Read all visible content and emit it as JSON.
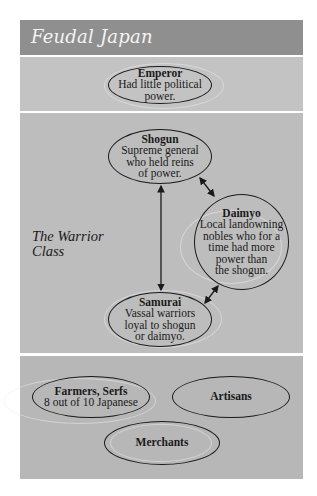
{
  "header": {
    "title": "Feudal Japan"
  },
  "sections": {
    "emperor": {
      "node": {
        "title": "Emperor",
        "description_lines": [
          "Had little political",
          "power."
        ]
      }
    },
    "warrior_class": {
      "label_lines": [
        "The Warrior",
        "Class"
      ],
      "shogun": {
        "title": "Shogun",
        "description_lines": [
          "Supreme general",
          "who held reins",
          "of power."
        ]
      },
      "daimyo": {
        "title": "Daimyo",
        "description_lines": [
          "Local landowning",
          "nobles who for a",
          "time had more",
          "power than",
          "the shogun."
        ]
      },
      "samurai": {
        "title": "Samurai",
        "description_lines": [
          "Vassal warriors",
          "loyal to shogun",
          "or daimyo."
        ]
      },
      "connections": [
        {
          "from": "Shogun",
          "to": "Samurai",
          "type": "double-arrow"
        },
        {
          "from": "Shogun",
          "to": "Daimyo",
          "type": "double-arrow"
        },
        {
          "from": "Samurai",
          "to": "Daimyo",
          "type": "double-arrow"
        }
      ]
    },
    "lower": {
      "farmers": {
        "title": "Farmers, Serfs",
        "description": "8 out of 10 Japanese"
      },
      "artisans": {
        "title": "Artisans"
      },
      "merchants": {
        "title": "Merchants"
      }
    }
  },
  "colors": {
    "header_bg": "#8f8f8f",
    "header_text": "#f4f4f4",
    "emperor_bg": "#c3c3c3",
    "warrior_bg": "#bdbdbd",
    "lower_bg": "#b7b7b7",
    "outline": "#1a1a1a"
  }
}
